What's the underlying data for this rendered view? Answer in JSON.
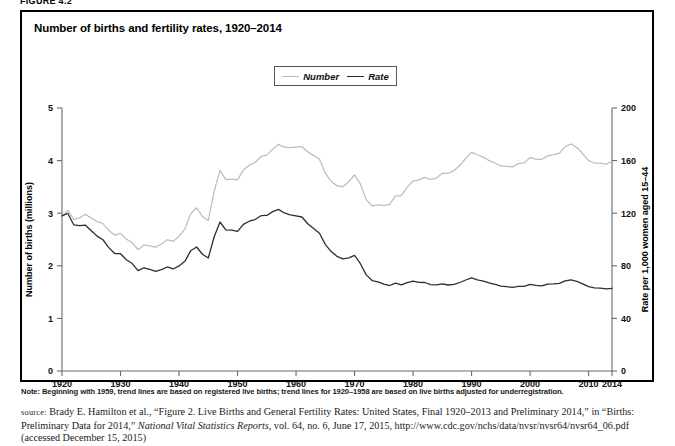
{
  "figure": {
    "label": "FIGURE 4.2"
  },
  "chart_title": "Number of births and fertility rates, 1920–2014",
  "legend": {
    "position": "top-center",
    "entries": [
      {
        "label": "Number",
        "color": "#bdbdbd",
        "style": "dotted-light"
      },
      {
        "label": "Rate",
        "color": "#2e2e2e",
        "style": "solid-dark"
      }
    ]
  },
  "note": "Note: Beginning with 1959, trend lines are based on registered live births; trend lines for 1920–1958 are based on live births adjusted for underregistration.",
  "source": {
    "prefix": "source:",
    "line1a": " Brady E. Hamilton et al., “Figure 2. Live Births and General Fertility Rates: United States, Final 1920–2013 and Preliminary 2014,” in “Births: Preliminary Data for 2014,” ",
    "italic1": "National Vital Statistics Reports",
    "line1b": ", vol. 64, no. 6, June 17, 2015, http://www.cdc.gov/nchs/data/nvsr/nvsr64/nvsr64_06.pdf (accessed December 15, 2015)"
  },
  "chart_data": {
    "type": "line",
    "title": "Number of births and fertility rates, 1920–2014",
    "xlabel": "",
    "ylabel": "Number of births (millions)",
    "y2label": "Rate per 1,000 women aged 15–44",
    "xlim": [
      1920,
      2014
    ],
    "ylim": [
      0,
      5
    ],
    "y2lim": [
      0,
      200
    ],
    "yticks": [
      0,
      1,
      2,
      3,
      4,
      5
    ],
    "y2ticks": [
      0,
      40,
      80,
      120,
      160,
      200
    ],
    "xticks": [
      1920,
      1930,
      1940,
      1950,
      1960,
      1970,
      1980,
      1990,
      2000,
      2010,
      2014
    ],
    "grid": false,
    "legend_position": "top-center",
    "x": [
      1920,
      1921,
      1922,
      1923,
      1924,
      1925,
      1926,
      1927,
      1928,
      1929,
      1930,
      1931,
      1932,
      1933,
      1934,
      1935,
      1936,
      1937,
      1938,
      1939,
      1940,
      1941,
      1942,
      1943,
      1944,
      1945,
      1946,
      1947,
      1948,
      1949,
      1950,
      1951,
      1952,
      1953,
      1954,
      1955,
      1956,
      1957,
      1958,
      1959,
      1960,
      1961,
      1962,
      1963,
      1964,
      1965,
      1966,
      1967,
      1968,
      1969,
      1970,
      1971,
      1972,
      1973,
      1974,
      1975,
      1976,
      1977,
      1978,
      1979,
      1980,
      1981,
      1982,
      1983,
      1984,
      1985,
      1986,
      1987,
      1988,
      1989,
      1990,
      1991,
      1992,
      1993,
      1994,
      1995,
      1996,
      1997,
      1998,
      1999,
      2000,
      2001,
      2002,
      2003,
      2004,
      2005,
      2006,
      2007,
      2008,
      2009,
      2010,
      2011,
      2012,
      2013,
      2014
    ],
    "series": [
      {
        "name": "Number",
        "units": "millions of births",
        "axis": "left",
        "color": "#bdbdbd",
        "values": [
          2.95,
          3.055,
          2.882,
          2.91,
          2.979,
          2.909,
          2.839,
          2.802,
          2.674,
          2.582,
          2.618,
          2.506,
          2.44,
          2.307,
          2.396,
          2.377,
          2.355,
          2.413,
          2.496,
          2.466,
          2.559,
          2.703,
          2.989,
          3.104,
          2.939,
          2.858,
          3.411,
          3.817,
          3.637,
          3.649,
          3.632,
          3.823,
          3.913,
          3.965,
          4.078,
          4.104,
          4.218,
          4.308,
          4.255,
          4.245,
          4.258,
          4.268,
          4.167,
          4.098,
          4.027,
          3.76,
          3.606,
          3.521,
          3.502,
          3.6,
          3.731,
          3.556,
          3.258,
          3.137,
          3.16,
          3.144,
          3.168,
          3.327,
          3.333,
          3.494,
          3.612,
          3.629,
          3.681,
          3.639,
          3.669,
          3.761,
          3.757,
          3.809,
          3.91,
          4.041,
          4.158,
          4.111,
          4.065,
          4.0,
          3.953,
          3.9,
          3.891,
          3.881,
          3.942,
          3.959,
          4.059,
          4.026,
          4.022,
          4.09,
          4.112,
          4.138,
          4.266,
          4.316,
          4.248,
          4.131,
          3.999,
          3.954,
          3.953,
          3.932,
          3.985
        ]
      },
      {
        "name": "Rate",
        "units": "births per 1,000 women aged 15–44",
        "axis": "right",
        "color": "#2e2e2e",
        "values": [
          117.9,
          119.8,
          111.2,
          110.5,
          110.9,
          106.6,
          102.6,
          99.8,
          93.8,
          89.3,
          89.2,
          84.6,
          81.7,
          76.3,
          78.5,
          77.2,
          75.8,
          77.1,
          79.1,
          77.6,
          79.9,
          83.4,
          91.5,
          94.3,
          88.8,
          85.9,
          101.9,
          113.3,
          107.3,
          107.1,
          106.2,
          111.5,
          113.9,
          115.2,
          118.1,
          118.3,
          121.2,
          122.9,
          120.2,
          118.8,
          118.0,
          117.1,
          112.0,
          108.3,
          104.7,
          96.3,
          90.8,
          87.2,
          85.2,
          86.1,
          87.9,
          81.6,
          73.1,
          68.8,
          67.8,
          66.0,
          65.0,
          66.8,
          65.5,
          67.2,
          68.4,
          67.4,
          67.3,
          65.7,
          65.5,
          66.3,
          65.4,
          65.8,
          67.3,
          69.2,
          70.9,
          69.3,
          68.4,
          67.0,
          65.9,
          64.6,
          64.1,
          63.6,
          64.3,
          64.4,
          65.9,
          65.1,
          64.8,
          66.1,
          66.3,
          66.7,
          68.5,
          69.3,
          68.1,
          66.2,
          64.1,
          63.2,
          63.0,
          62.5,
          62.9
        ]
      }
    ]
  },
  "axes": {
    "left_title": "Number of births (millions)",
    "right_title": "Rate per 1,000 women aged 15–44",
    "left_ticks": [
      "0",
      "1",
      "2",
      "3",
      "4",
      "5"
    ],
    "right_ticks": [
      "0",
      "40",
      "80",
      "120",
      "160",
      "200"
    ],
    "x_ticks": [
      "1920",
      "1930",
      "1940",
      "1950",
      "1960",
      "1970",
      "1980",
      "1990",
      "2000",
      "2010",
      "2014"
    ]
  }
}
